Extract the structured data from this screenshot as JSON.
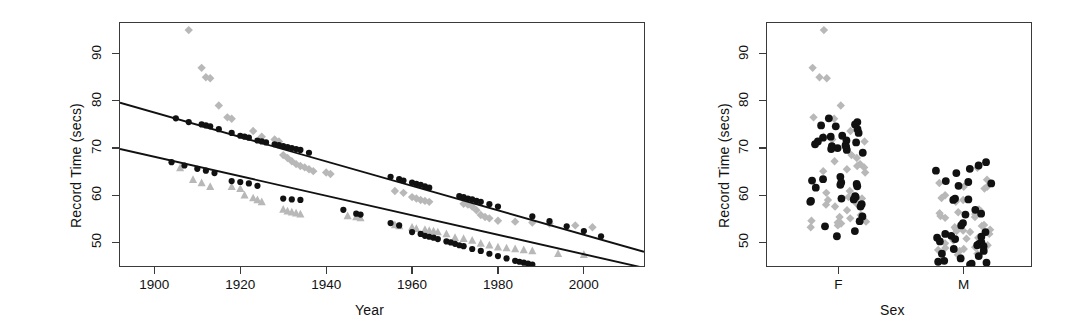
{
  "figure": {
    "background": "#ffffff",
    "width": 1085,
    "height": 331,
    "black": "#111111",
    "gray": "#b8b8b8",
    "axis_color": "#3a3a3a"
  },
  "panels": {
    "left": {
      "name": "record-time-vs-year",
      "xlabel": "Year",
      "ylabel": "Record Time (secs)",
      "xticks": [
        "1900",
        "1920",
        "1940",
        "1960",
        "1980",
        "2000"
      ],
      "yticks": [
        "50",
        "60",
        "70",
        "80",
        "90"
      ]
    },
    "right": {
      "name": "record-time-by-sex",
      "xlabel": "Sex",
      "ylabel": "Record Time (secs)",
      "xticks": [
        "F",
        "M"
      ],
      "yticks": [
        "50",
        "60",
        "70",
        "80",
        "90"
      ]
    }
  },
  "chart_data": [
    {
      "type": "scatter",
      "id": "left-panel",
      "title": "",
      "xlabel": "Year",
      "ylabel": "Record Time (secs)",
      "xlim": [
        1892,
        2014
      ],
      "ylim": [
        45.0,
        96.5
      ],
      "xticks": [
        1900,
        1920,
        1940,
        1960,
        1980,
        2000
      ],
      "yticks": [
        50,
        60,
        70,
        80,
        90
      ],
      "grid": false,
      "legend": "none",
      "series": [
        {
          "name": "Female fitted line",
          "type": "line",
          "marker": "none",
          "color": "#111111",
          "x": [
            1892,
            2014
          ],
          "y": [
            79.6,
            48.0
          ]
        },
        {
          "name": "Male fitted line",
          "type": "line",
          "marker": "none",
          "color": "#111111",
          "x": [
            1892,
            2014
          ],
          "y": [
            69.8,
            44.6
          ]
        },
        {
          "name": "Female fitted points",
          "type": "scatter",
          "marker": "filled-circle",
          "color": "#111111",
          "points": [
            [
              1905,
              76.3
            ],
            [
              1908,
              75.5
            ],
            [
              1911,
              75.0
            ],
            [
              1912,
              74.8
            ],
            [
              1913,
              74.6
            ],
            [
              1915,
              74.0
            ],
            [
              1918,
              73.2
            ],
            [
              1920,
              72.6
            ],
            [
              1921,
              72.4
            ],
            [
              1922,
              72.2
            ],
            [
              1924,
              71.6
            ],
            [
              1925,
              71.4
            ],
            [
              1926,
              71.2
            ],
            [
              1928,
              70.8
            ],
            [
              1929,
              70.6
            ],
            [
              1930,
              70.4
            ],
            [
              1931,
              70.2
            ],
            [
              1932,
              70.0
            ],
            [
              1933,
              69.8
            ],
            [
              1934,
              69.6
            ],
            [
              1936,
              69.0
            ],
            [
              1955,
              63.9
            ],
            [
              1957,
              63.4
            ],
            [
              1958,
              63.1
            ],
            [
              1960,
              62.7
            ],
            [
              1961,
              62.4
            ],
            [
              1962,
              62.2
            ],
            [
              1963,
              61.9
            ],
            [
              1964,
              61.6
            ],
            [
              1971,
              59.8
            ],
            [
              1972,
              59.6
            ],
            [
              1973,
              59.3
            ],
            [
              1974,
              59.1
            ],
            [
              1975,
              58.8
            ],
            [
              1976,
              58.6
            ],
            [
              1978,
              58.1
            ],
            [
              1980,
              57.6
            ],
            [
              1988,
              55.5
            ],
            [
              1992,
              54.5
            ],
            [
              1996,
              53.4
            ],
            [
              2000,
              52.4
            ],
            [
              2004,
              51.3
            ]
          ]
        },
        {
          "name": "Male fitted points",
          "type": "scatter",
          "marker": "filled-circle",
          "color": "#111111",
          "points": [
            [
              1904,
              67.0
            ],
            [
              1907,
              66.3
            ],
            [
              1910,
              65.6
            ],
            [
              1912,
              65.2
            ],
            [
              1914,
              64.7
            ],
            [
              1918,
              63.0
            ],
            [
              1920,
              62.8
            ],
            [
              1922,
              62.5
            ],
            [
              1924,
              62.0
            ],
            [
              1930,
              59.3
            ],
            [
              1932,
              59.1
            ],
            [
              1934,
              59.0
            ],
            [
              1944,
              56.9
            ],
            [
              1947,
              56.1
            ],
            [
              1948,
              55.9
            ],
            [
              1955,
              54.1
            ],
            [
              1957,
              53.6
            ],
            [
              1960,
              52.2
            ],
            [
              1962,
              51.8
            ],
            [
              1963,
              51.4
            ],
            [
              1964,
              51.2
            ],
            [
              1965,
              51.0
            ],
            [
              1966,
              50.7
            ],
            [
              1968,
              50.2
            ],
            [
              1969,
              50.0
            ],
            [
              1970,
              49.7
            ],
            [
              1971,
              49.4
            ],
            [
              1972,
              49.2
            ],
            [
              1974,
              48.6
            ],
            [
              1976,
              48.2
            ],
            [
              1978,
              47.6
            ],
            [
              1980,
              47.1
            ],
            [
              1982,
              46.6
            ],
            [
              1984,
              46.1
            ],
            [
              1985,
              45.9
            ],
            [
              1986,
              45.7
            ],
            [
              1987,
              45.5
            ],
            [
              1988,
              45.3
            ]
          ]
        },
        {
          "name": "Female observed",
          "type": "scatter",
          "marker": "diamond",
          "color": "#b8b8b8",
          "points": [
            [
              1908,
              95.0
            ],
            [
              1911,
              87.0
            ],
            [
              1912,
              85.0
            ],
            [
              1913,
              84.8
            ],
            [
              1915,
              79.0
            ],
            [
              1917,
              76.5
            ],
            [
              1918,
              76.2
            ],
            [
              1923,
              73.6
            ],
            [
              1925,
              72.4
            ],
            [
              1928,
              71.8
            ],
            [
              1929,
              71.4
            ],
            [
              1930,
              68.5
            ],
            [
              1931,
              67.9
            ],
            [
              1932,
              67.2
            ],
            [
              1933,
              66.6
            ],
            [
              1934,
              66.2
            ],
            [
              1935,
              65.9
            ],
            [
              1936,
              65.5
            ],
            [
              1937,
              65.1
            ],
            [
              1940,
              64.8
            ],
            [
              1941,
              64.5
            ],
            [
              1956,
              60.9
            ],
            [
              1958,
              60.5
            ],
            [
              1960,
              59.6
            ],
            [
              1961,
              59.3
            ],
            [
              1962,
              59.0
            ],
            [
              1963,
              58.8
            ],
            [
              1964,
              58.6
            ],
            [
              1972,
              58.2
            ],
            [
              1973,
              58.0
            ],
            [
              1974,
              57.6
            ],
            [
              1975,
              56.8
            ],
            [
              1976,
              55.8
            ],
            [
              1977,
              55.4
            ],
            [
              1978,
              55.1
            ],
            [
              1980,
              54.6
            ],
            [
              1984,
              54.4
            ],
            [
              1988,
              54.2
            ],
            [
              1992,
              54.0
            ],
            [
              1998,
              53.6
            ],
            [
              2002,
              53.2
            ]
          ]
        },
        {
          "name": "Male observed",
          "type": "scatter",
          "marker": "triangle",
          "color": "#b8b8b8",
          "points": [
            [
              1906,
              65.8
            ],
            [
              1909,
              63.3
            ],
            [
              1911,
              62.6
            ],
            [
              1913,
              61.8
            ],
            [
              1918,
              61.8
            ],
            [
              1920,
              61.4
            ],
            [
              1921,
              60.0
            ],
            [
              1923,
              59.4
            ],
            [
              1924,
              59.0
            ],
            [
              1925,
              58.6
            ],
            [
              1930,
              57.0
            ],
            [
              1931,
              56.6
            ],
            [
              1932,
              56.4
            ],
            [
              1933,
              56.2
            ],
            [
              1934,
              56.0
            ],
            [
              1945,
              55.6
            ],
            [
              1947,
              55.4
            ],
            [
              1948,
              55.2
            ],
            [
              1956,
              53.7
            ],
            [
              1957,
              53.5
            ],
            [
              1960,
              53.2
            ],
            [
              1961,
              52.9
            ],
            [
              1963,
              52.7
            ],
            [
              1964,
              52.5
            ],
            [
              1965,
              52.4
            ],
            [
              1966,
              52.2
            ],
            [
              1968,
              51.8
            ],
            [
              1970,
              51.0
            ],
            [
              1972,
              50.8
            ],
            [
              1974,
              50.4
            ],
            [
              1976,
              49.8
            ],
            [
              1978,
              49.4
            ],
            [
              1980,
              49.0
            ],
            [
              1982,
              48.8
            ],
            [
              1984,
              48.6
            ],
            [
              1986,
              48.4
            ],
            [
              1988,
              48.2
            ],
            [
              1994,
              47.6
            ],
            [
              2000,
              47.4
            ]
          ]
        }
      ]
    },
    {
      "type": "scatter",
      "id": "right-panel",
      "title": "",
      "xlabel": "Sex",
      "ylabel": "Record Time (secs)",
      "categories": [
        "F",
        "M"
      ],
      "ylim": [
        45.0,
        96.5
      ],
      "yticks": [
        50,
        60,
        70,
        80,
        90
      ],
      "grid": false,
      "legend": "none",
      "series": [
        {
          "name": "F observed",
          "type": "strip",
          "marker": "diamond",
          "color": "#b8b8b8",
          "category": "F",
          "values": [
            95.0,
            87.0,
            85.0,
            84.8,
            79.0,
            76.5,
            76.2,
            73.6,
            72.4,
            71.8,
            71.4,
            68.5,
            67.9,
            67.2,
            66.6,
            66.2,
            65.9,
            65.5,
            65.1,
            64.8,
            60.9,
            60.5,
            59.6,
            59.3,
            59.0,
            58.8,
            58.6,
            58.2,
            58.0,
            57.6,
            56.8,
            55.8,
            55.4,
            55.1,
            54.6,
            54.4,
            54.2,
            54.0,
            53.6,
            53.2
          ]
        },
        {
          "name": "F fitted",
          "type": "strip",
          "marker": "filled-circle",
          "color": "#111111",
          "category": "F",
          "values": [
            76.3,
            75.5,
            75.0,
            74.8,
            74.6,
            74.0,
            73.2,
            72.6,
            72.4,
            72.2,
            71.6,
            71.4,
            71.2,
            70.8,
            70.6,
            70.4,
            70.2,
            70.0,
            69.8,
            69.6,
            69.0,
            63.9,
            63.4,
            63.1,
            62.7,
            62.4,
            62.2,
            61.9,
            61.6,
            59.8,
            59.6,
            59.3,
            59.1,
            58.8,
            58.6,
            58.1,
            57.6,
            55.5,
            54.5,
            53.4,
            52.4,
            51.3
          ]
        },
        {
          "name": "M observed",
          "type": "strip",
          "marker": "diamond",
          "color": "#b8b8b8",
          "category": "M",
          "values": [
            65.8,
            63.3,
            62.6,
            61.8,
            61.8,
            61.4,
            60.0,
            59.4,
            59.0,
            58.6,
            57.0,
            56.6,
            56.4,
            56.2,
            56.0,
            55.6,
            55.4,
            55.2,
            53.7,
            53.5,
            53.2,
            52.9,
            52.7,
            52.5,
            52.4,
            52.2,
            51.8,
            51.0,
            50.8,
            50.4,
            49.8,
            49.4,
            49.0,
            48.8,
            48.6,
            48.4,
            48.2,
            47.6,
            47.4
          ]
        },
        {
          "name": "M fitted",
          "type": "strip",
          "marker": "filled-circle",
          "color": "#111111",
          "category": "M",
          "values": [
            67.0,
            66.3,
            65.6,
            65.2,
            64.7,
            63.0,
            62.8,
            62.5,
            62.0,
            59.3,
            59.1,
            59.0,
            56.9,
            56.1,
            55.9,
            54.1,
            53.6,
            52.2,
            51.8,
            51.4,
            51.2,
            51.0,
            50.7,
            50.2,
            50.0,
            49.7,
            49.4,
            49.2,
            48.6,
            48.2,
            47.6,
            47.1,
            46.6,
            46.1,
            45.9,
            45.7,
            45.5,
            45.3
          ]
        }
      ]
    }
  ]
}
